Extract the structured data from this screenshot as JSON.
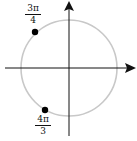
{
  "diagram": {
    "type": "unit-circle",
    "colors": {
      "circle": "#c8c8c8",
      "axes": "#111111",
      "points": "#000000"
    },
    "circle": {
      "cx": 69,
      "cy": 68,
      "r": 48
    },
    "points": [
      {
        "angle": "3π/4",
        "numerator": "3π",
        "denominator": "4"
      },
      {
        "angle": "4π/3",
        "numerator": "4π",
        "denominator": "3"
      }
    ]
  }
}
